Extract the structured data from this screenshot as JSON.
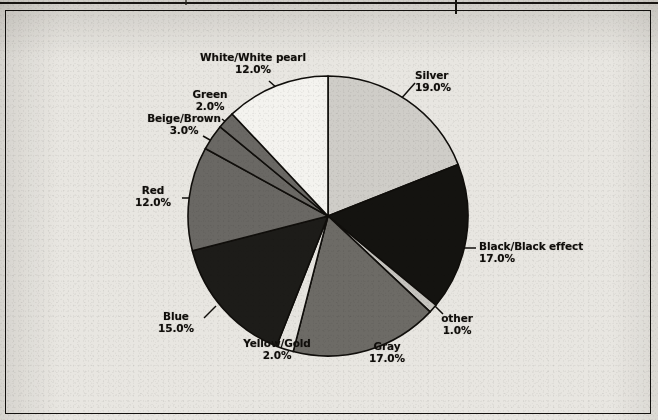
{
  "document": {
    "kind": "scanned-pie-chart",
    "background_color": "#e8e6e1",
    "frame_color": "#14120f"
  },
  "chart_data": {
    "type": "pie",
    "title": "",
    "subtitle": "",
    "xlabel": "",
    "ylabel": "",
    "legend_position": "none",
    "labels_position": "outside-with-leader-lines",
    "start_angle_deg": 0,
    "direction": "clockwise",
    "units": "percent",
    "total": 100.0,
    "categories": [
      "Silver",
      "Black/Black effect",
      "other",
      "Gray",
      "Yellow/Gold",
      "Blue",
      "Red",
      "Beige/Brown",
      "Green",
      "White/White pearl"
    ],
    "values": [
      19.0,
      17.0,
      1.0,
      17.0,
      2.0,
      15.0,
      12.0,
      3.0,
      2.0,
      12.0
    ],
    "value_labels": [
      "19.0%",
      "17.0%",
      "1.0%",
      "17.0%",
      "2.0%",
      "15.0%",
      "12.0%",
      "3.0%",
      "2.0%",
      "12.0%"
    ],
    "slice_fills": [
      "#cfcdc8",
      "#141310",
      "#c6c4bf",
      "#6d6b66",
      "#e6e4df",
      "#1d1c19",
      "#6a6864",
      "#6a6864",
      "#6a6864",
      "#f4f3ef"
    ],
    "slice_stroke": "#100e0b",
    "slices": [
      {
        "name": "Silver",
        "value": 19.0,
        "label": "Silver",
        "pct": "19.0%",
        "fill": "#cfcdc8"
      },
      {
        "name": "Black/Black effect",
        "value": 17.0,
        "label": "Black/Black effect",
        "pct": "17.0%",
        "fill": "#141310"
      },
      {
        "name": "other",
        "value": 1.0,
        "label": "other",
        "pct": "1.0%",
        "fill": "#c6c4bf"
      },
      {
        "name": "Gray",
        "value": 17.0,
        "label": "Gray",
        "pct": "17.0%",
        "fill": "#6d6b66"
      },
      {
        "name": "Yellow/Gold",
        "value": 2.0,
        "label": "Yellow/Gold",
        "pct": "2.0%",
        "fill": "#e6e4df"
      },
      {
        "name": "Blue",
        "value": 15.0,
        "label": "Blue",
        "pct": "15.0%",
        "fill": "#1d1c19"
      },
      {
        "name": "Red",
        "value": 12.0,
        "label": "Red",
        "pct": "12.0%",
        "fill": "#6a6864"
      },
      {
        "name": "Beige/Brown",
        "value": 3.0,
        "label": "Beige/Brown",
        "pct": "3.0%",
        "fill": "#6a6864"
      },
      {
        "name": "Green",
        "value": 2.0,
        "label": "Green",
        "pct": "2.0%",
        "fill": "#6a6864"
      },
      {
        "name": "White/White pearl",
        "value": 12.0,
        "label": "White/White pearl",
        "pct": "12.0%",
        "fill": "#f4f3ef"
      }
    ]
  }
}
